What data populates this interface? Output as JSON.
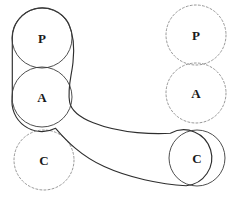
{
  "figure": {
    "name": "belt-pulley-configuration-diagram",
    "width": 239,
    "height": 202,
    "background_color": "#ffffff"
  },
  "style": {
    "solid_stroke_color": "#3b3b3b",
    "dashed_stroke_color": "#8c8c8c",
    "band_stroke_color": "#2e2e2e",
    "label_color": "#1a1a1a"
  },
  "nodes": [
    {
      "id": "p-left",
      "label": "P",
      "cx": 42,
      "cy": 38,
      "r": 30,
      "state": "solid",
      "column": "left"
    },
    {
      "id": "a-left",
      "label": "A",
      "cx": 42,
      "cy": 97,
      "r": 30,
      "state": "solid",
      "column": "left"
    },
    {
      "id": "c-left",
      "label": "C",
      "cx": 44,
      "cy": 160,
      "r": 30,
      "state": "dashed",
      "column": "left"
    },
    {
      "id": "p-right",
      "label": "P",
      "cx": 196,
      "cy": 35,
      "r": 30,
      "state": "dashed",
      "column": "right"
    },
    {
      "id": "a-right",
      "label": "A",
      "cx": 196,
      "cy": 93,
      "r": 30,
      "state": "dashed",
      "column": "right"
    },
    {
      "id": "c-right",
      "label": "C",
      "cx": 197,
      "cy": 158,
      "r": 28,
      "state": "solid",
      "column": "right"
    }
  ],
  "band": {
    "description": "closed band wrapping the solid P, A and C pulleys",
    "outline_path": "M 12.3 38 A 30 30 0 0 1 68.5 23.3 C 73.6 34.8 74.3 49.3 73.0 62.0 C 71.6 76.5 67.4 87.7 69.6 101.6 C 72.4 119.3 107.0 129.7 137.0 132.5 C 152.5 133.9 163.0 133.7 170.2 133.1 A 28 28 0 1 1 186.0 185.6 C 160.0 184.3 128.0 177.5 104.0 166.5 C 80.5 155.7 66.5 141.0 55.5 128.2 A 30 30 0 0 1 12.3 97 Z"
  },
  "legend": {
    "solid_meaning": "current pulley position",
    "dashed_meaning": "alternative pulley position"
  }
}
